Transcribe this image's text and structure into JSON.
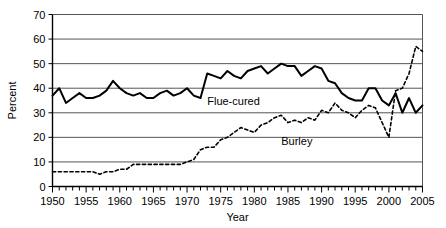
{
  "chart_data": {
    "type": "line",
    "title": "",
    "xlabel": "Year",
    "ylabel": "Percent",
    "xlim": [
      1950,
      2005
    ],
    "ylim": [
      0,
      70
    ],
    "ytick_step": 10,
    "yticks": [
      0,
      10,
      20,
      30,
      40,
      50,
      60,
      70
    ],
    "xticks_major": [
      1950,
      1955,
      1960,
      1965,
      1970,
      1975,
      1980,
      1985,
      1990,
      1995,
      2000,
      2005
    ],
    "xtick_minor_step": 1,
    "grid": "horizontal",
    "legend_position": "inline-annotation",
    "x": [
      1950,
      1951,
      1952,
      1953,
      1954,
      1955,
      1956,
      1957,
      1958,
      1959,
      1960,
      1961,
      1962,
      1963,
      1964,
      1965,
      1966,
      1967,
      1968,
      1969,
      1970,
      1971,
      1972,
      1973,
      1974,
      1975,
      1976,
      1977,
      1978,
      1979,
      1980,
      1981,
      1982,
      1983,
      1984,
      1985,
      1986,
      1987,
      1988,
      1989,
      1990,
      1991,
      1992,
      1993,
      1994,
      1995,
      1996,
      1997,
      1998,
      1999,
      2000,
      2001,
      2002,
      2003,
      2004,
      2005
    ],
    "series": [
      {
        "name": "Flue-cured",
        "style": "solid",
        "color": "#000000",
        "label": "Flue-cured",
        "label_x": 1973,
        "label_y": 33,
        "values": [
          37,
          40,
          34,
          36,
          38,
          36,
          36,
          37,
          39,
          43,
          40,
          38,
          37,
          38,
          36,
          36,
          38,
          39,
          37,
          38,
          40,
          37,
          36,
          46,
          45,
          44,
          47,
          45,
          44,
          47,
          48,
          49,
          46,
          48,
          50,
          49,
          49,
          45,
          47,
          49,
          48,
          43,
          42,
          38,
          36,
          35,
          35,
          40,
          40,
          35,
          33,
          38,
          30,
          36,
          30,
          33
        ]
      },
      {
        "name": "Burley",
        "style": "dotted",
        "color": "#000000",
        "label": "Burley",
        "label_x": 1984,
        "label_y": 17,
        "values": [
          6,
          6,
          6,
          6,
          6,
          6,
          6,
          5,
          6,
          6,
          7,
          7,
          9,
          9,
          9,
          9,
          9,
          9,
          9,
          9,
          10,
          11,
          15,
          16,
          16,
          19,
          20,
          22,
          24,
          23,
          22,
          25,
          26,
          28,
          29,
          26,
          27,
          26,
          28,
          27,
          31,
          30,
          34,
          31,
          30,
          28,
          31,
          33,
          32,
          26,
          20,
          39,
          40,
          46,
          57,
          55
        ]
      }
    ]
  }
}
